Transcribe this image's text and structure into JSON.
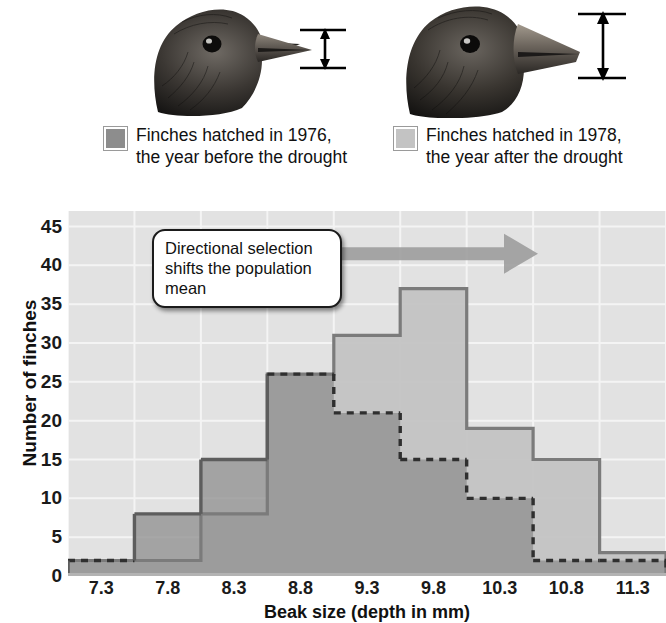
{
  "figure": {
    "birds": [
      {
        "name": "finch-1976-head",
        "caption_year": "1976",
        "beak": "shallow"
      },
      {
        "name": "finch-1978-head",
        "caption_year": "1978",
        "beak": "deep"
      }
    ]
  },
  "legend": {
    "position": "above-chart",
    "entries": [
      {
        "label_line1": "Finches hatched in 1976,",
        "label_line2": "the year before the drought",
        "color": "#8d8d8d"
      },
      {
        "label_line1": "Finches hatched in 1978,",
        "label_line2": "the year after the drought",
        "color": "#c3c3c3"
      }
    ]
  },
  "callout": {
    "text": "Directional selection shifts the population mean"
  },
  "arrow": {
    "name": "directional-selection-arrow",
    "direction": "right",
    "color": "#9d9d9d"
  },
  "chart_data": {
    "type": "bar",
    "title": "",
    "xlabel": "Beak size (depth in mm)",
    "ylabel": "Number of finches",
    "categories": [
      "7.3",
      "7.8",
      "8.3",
      "8.8",
      "9.3",
      "9.8",
      "10.3",
      "10.8",
      "11.3"
    ],
    "bin_edges": [
      7.05,
      7.55,
      8.05,
      8.55,
      9.05,
      9.55,
      10.05,
      10.55,
      11.05,
      11.55
    ],
    "xtick_labels": [
      "7.3",
      "7.8",
      "8.3",
      "8.8",
      "9.3",
      "9.8",
      "10.3",
      "10.8",
      "11.3"
    ],
    "ytick_labels": [
      "0",
      "5",
      "10",
      "15",
      "20",
      "25",
      "30",
      "35",
      "40",
      "45"
    ],
    "ylim": [
      0,
      47
    ],
    "ytick_step": 5,
    "grid": true,
    "legend_position": "above",
    "series": [
      {
        "name": "Finches hatched in 1976, the year before the drought",
        "color": "#8d8d8d",
        "outline": "#5d5d5d",
        "style": "solid-with-dashed-hidden-portion",
        "values": [
          2,
          8,
          15,
          26,
          21,
          15,
          10,
          2,
          2
        ]
      },
      {
        "name": "Finches hatched in 1978, the year after the drought",
        "color": "#c3c3c3",
        "outline": "#7b7b7b",
        "style": "solid",
        "values": [
          2,
          2,
          8,
          26,
          31,
          37,
          19,
          15,
          3
        ]
      }
    ]
  }
}
